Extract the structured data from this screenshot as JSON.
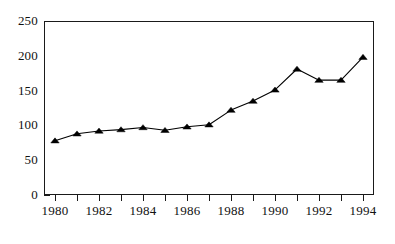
{
  "chart_data": {
    "type": "line",
    "title": "",
    "subtitle": "",
    "xlabel": "",
    "ylabel": "",
    "x": [
      1980,
      1981,
      1982,
      1983,
      1984,
      1985,
      1986,
      1987,
      1988,
      1989,
      1990,
      1991,
      1992,
      1993,
      1994
    ],
    "values": [
      78,
      88,
      92,
      94,
      97,
      93,
      98,
      101,
      122,
      135,
      151,
      181,
      165,
      165,
      198
    ],
    "series": [
      {
        "name": "series-1",
        "values": [
          78,
          88,
          92,
          94,
          97,
          93,
          98,
          101,
          122,
          135,
          151,
          181,
          165,
          165,
          198
        ]
      }
    ],
    "xlim": [
      1979.5,
      1994.5
    ],
    "ylim": [
      0,
      250
    ],
    "ytick_values": [
      0,
      50,
      100,
      150,
      200,
      250
    ],
    "ytick_labels": [
      "0",
      "50",
      "100",
      "150",
      "200",
      "250"
    ],
    "xtick_values": [
      1980,
      1981,
      1982,
      1983,
      1984,
      1985,
      1986,
      1987,
      1988,
      1989,
      1990,
      1991,
      1992,
      1993,
      1994
    ],
    "xtick_labels": [
      "1980",
      "",
      "1982",
      "",
      "1984",
      "",
      "1986",
      "",
      "1988",
      "",
      "1990",
      "",
      "1992",
      "",
      "1994"
    ],
    "grid": false,
    "legend": false,
    "legend_position": "none",
    "marker": "triangle-up",
    "line_color": "#000000",
    "marker_color": "#000000",
    "background_color": "#ffffff",
    "axis_color": "#1a1a1a",
    "annotations": []
  }
}
